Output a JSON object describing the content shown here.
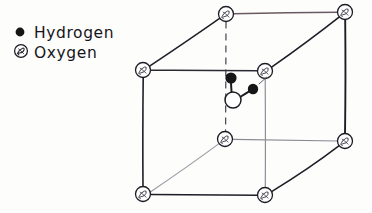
{
  "figure": {
    "kind": "hand-drawn-diagram",
    "background_color": "#fdfdfc",
    "ink_color": "#1b1b22",
    "faint_ink_color": "#7d7d88",
    "tinted_edge_color": "#6b5a63"
  },
  "legend": {
    "name": "legend",
    "items": [
      {
        "id": "hydrogen",
        "label": "Hydrogen",
        "icon": "filled-dot-icon",
        "marker_style": "solid-black-circle",
        "marker_color": "#121217",
        "marker_x": 20,
        "marker_y": 32,
        "marker_r": 4.4,
        "label_x": 34,
        "label_y": 38
      },
      {
        "id": "oxygen",
        "label": "Oxygen",
        "icon": "hatched-circle-icon",
        "marker_style": "open-circle-with-scribble",
        "marker_color": "#1b1b22",
        "marker_x": 21,
        "marker_y": 51,
        "marker_r": 6.4,
        "label_x": 34,
        "label_y": 58
      }
    ]
  },
  "cell": {
    "name": "cubic-unit-cell",
    "description": "Cube drawn in oblique projection with oxygen atoms at all eight corners",
    "vertices": [
      {
        "id": "top-back-left",
        "x": 226,
        "y": 14,
        "r": 7.5,
        "species": "Oxygen",
        "position": "back"
      },
      {
        "id": "top-back-right",
        "x": 345,
        "y": 12,
        "r": 7.5,
        "species": "Oxygen",
        "position": "back"
      },
      {
        "id": "top-front-left",
        "x": 143,
        "y": 70,
        "r": 7.5,
        "species": "Oxygen",
        "position": "front"
      },
      {
        "id": "top-front-right",
        "x": 265,
        "y": 71,
        "r": 7.5,
        "species": "Oxygen",
        "position": "front"
      },
      {
        "id": "bottom-back-left",
        "x": 225,
        "y": 139,
        "r": 7.5,
        "species": "Oxygen",
        "position": "back"
      },
      {
        "id": "bottom-back-right",
        "x": 345,
        "y": 141,
        "r": 7.5,
        "species": "Oxygen",
        "position": "back"
      },
      {
        "id": "bottom-front-left",
        "x": 143,
        "y": 194,
        "r": 7.5,
        "species": "Oxygen",
        "position": "front"
      },
      {
        "id": "bottom-front-right",
        "x": 265,
        "y": 195,
        "r": 7.5,
        "species": "Oxygen",
        "position": "front"
      }
    ],
    "edges": [
      {
        "id": "top-front-edge",
        "from": "top-front-left",
        "to": "top-front-right",
        "style": "solid"
      },
      {
        "id": "top-back-edge",
        "from": "top-back-left",
        "to": "top-back-right",
        "style": "solid-tinted"
      },
      {
        "id": "top-left-edge",
        "from": "top-front-left",
        "to": "top-back-left",
        "style": "solid"
      },
      {
        "id": "top-right-edge",
        "from": "top-front-right",
        "to": "top-back-right",
        "style": "solid"
      },
      {
        "id": "bottom-front-edge",
        "from": "bottom-front-left",
        "to": "bottom-front-right",
        "style": "solid"
      },
      {
        "id": "bottom-back-edge",
        "from": "bottom-back-left",
        "to": "bottom-back-right",
        "style": "faint"
      },
      {
        "id": "bottom-left-edge",
        "from": "bottom-front-left",
        "to": "bottom-back-left",
        "style": "faint"
      },
      {
        "id": "bottom-right-edge",
        "from": "bottom-front-right",
        "to": "bottom-back-right",
        "style": "solid"
      },
      {
        "id": "vertical-front-left",
        "from": "top-front-left",
        "to": "bottom-front-left",
        "style": "solid"
      },
      {
        "id": "vertical-front-right",
        "from": "top-front-right",
        "to": "bottom-front-right",
        "style": "faint"
      },
      {
        "id": "vertical-back-left",
        "from": "top-back-left",
        "to": "bottom-back-left",
        "style": "dashed"
      },
      {
        "id": "vertical-back-right",
        "from": "top-back-right",
        "to": "bottom-back-right",
        "style": "solid"
      }
    ]
  },
  "molecule": {
    "name": "water-molecule",
    "formula": "H2O",
    "atoms": [
      {
        "id": "central-oxygen",
        "species": "Oxygen",
        "x": 233,
        "y": 100,
        "r": 8.0,
        "fill": "#ffffff"
      },
      {
        "id": "hydrogen-upper",
        "species": "Hydrogen",
        "x": 231,
        "y": 78,
        "r": 5.6,
        "fill": "#121217"
      },
      {
        "id": "hydrogen-right",
        "species": "Hydrogen",
        "x": 253,
        "y": 89,
        "r": 5.2,
        "fill": "#121217"
      }
    ],
    "bonds": [
      {
        "id": "bond-o-h-upper",
        "from": "central-oxygen",
        "to": "hydrogen-upper"
      },
      {
        "id": "bond-o-h-right",
        "from": "central-oxygen",
        "to": "hydrogen-right"
      }
    ],
    "lone_mark": {
      "id": "stray-tick",
      "x1": 259,
      "y1": 84,
      "x2": 267,
      "y2": 77
    }
  }
}
